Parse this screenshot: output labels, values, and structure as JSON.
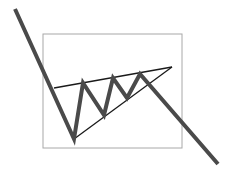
{
  "diagram": {
    "colors": {
      "background": "#ffffff",
      "price_line": "#4a4a4a",
      "trendline": "#1a1a1a",
      "frame": "#a8a8a8"
    },
    "frame": {
      "x": 43,
      "y": 34,
      "width": 139,
      "height": 114
    },
    "price_path": [
      [
        15,
        9
      ],
      [
        74,
        139
      ],
      [
        83,
        83
      ],
      [
        104,
        115
      ],
      [
        113,
        78
      ],
      [
        127,
        98
      ],
      [
        140,
        74
      ],
      [
        218,
        164
      ]
    ],
    "upper_trendline": [
      [
        54,
        88
      ],
      [
        172,
        67
      ]
    ],
    "lower_trendline": [
      [
        74,
        139
      ],
      [
        172,
        67
      ]
    ]
  }
}
